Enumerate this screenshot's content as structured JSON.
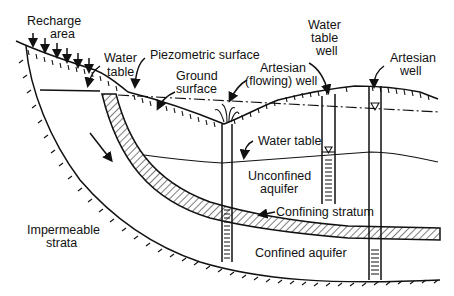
{
  "diagram": {
    "type": "cross-section",
    "labels": {
      "recharge_area_1": "Recharge",
      "recharge_area_2": "area",
      "water_table_left_1": "Water",
      "water_table_left_2": "table",
      "piezometric_surface": "Piezometric surface",
      "ground_surface_1": "Ground",
      "ground_surface_2": "surface",
      "artesian_flowing_well_1": "Artesian",
      "artesian_flowing_well_2": "(flowing) well",
      "water_table_well_1": "Water",
      "water_table_well_2": "table",
      "water_table_well_3": "well",
      "artesian_well_1": "Artesian",
      "artesian_well_2": "well",
      "water_table": "Water table",
      "unconfined_aquifer_1": "Unconfined",
      "unconfined_aquifer_2": "aquifer",
      "confining_stratum": "Confining stratum",
      "confined_aquifer": "Confined aquifer",
      "impermeable_strata_1": "Impermeable",
      "impermeable_strata_2": "strata"
    },
    "colors": {
      "line": "#111111",
      "background": "#ffffff"
    }
  }
}
